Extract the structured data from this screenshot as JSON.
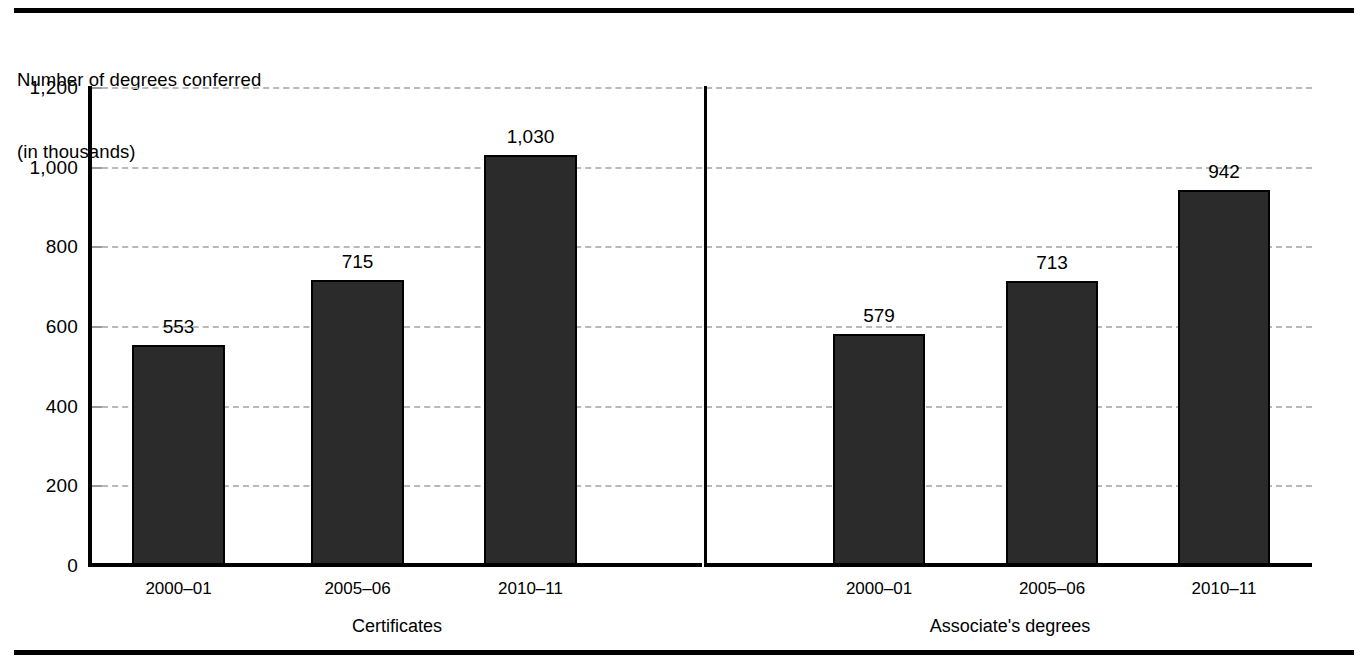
{
  "chart_data": {
    "type": "bar",
    "title": "Number of degrees conferred\n(in thousands)",
    "title_line1": "Number of degrees conferred",
    "title_line2": "(in thousands)",
    "xlabel": "",
    "ylabel": "Number of degrees conferred (in thousands)",
    "ylim": [
      0,
      1200
    ],
    "ytick_labels": [
      "0",
      "200",
      "400",
      "600",
      "800",
      "1,000",
      "1,200"
    ],
    "ytick_values": [
      0,
      200,
      400,
      600,
      800,
      1000,
      1200
    ],
    "grid": true,
    "grid_style": "dashed-light-gray",
    "legend": "none",
    "categories": [
      "2000–01",
      "2005–06",
      "2010–11"
    ],
    "panels": [
      {
        "name": "Certificates",
        "categories": [
          "2000–01",
          "2005–06",
          "2010–11"
        ],
        "values": [
          553,
          715,
          1030
        ],
        "value_labels": [
          "553",
          "715",
          "1,030"
        ]
      },
      {
        "name": "Associate's degrees",
        "categories": [
          "2000–01",
          "2005–06",
          "2010–11"
        ],
        "values": [
          579,
          713,
          942
        ],
        "value_labels": [
          "579",
          "713",
          "942"
        ]
      }
    ],
    "colors": {
      "bar_fill": "#2b2b2b",
      "bar_edge": "#000000",
      "axis": "#000000",
      "gridline": "#b9b9b9",
      "background": "#ffffff",
      "text": "#000000"
    }
  }
}
